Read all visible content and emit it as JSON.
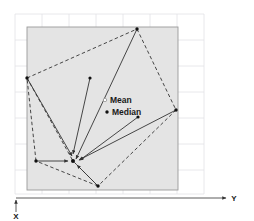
{
  "figure": {
    "title": "",
    "background_color": "#ffffff",
    "plot_fill_color": "#e4e4e4",
    "plot_border_color": "#9a9a9a",
    "grid_color": "#e0e0e4",
    "line_color": "#3a3a3a",
    "point_color": "#111111"
  },
  "axes": {
    "x_label": "X",
    "y_label": "Y",
    "x_axis_name": "vertical-axis",
    "y_axis_name": "horizontal-axis",
    "axis_color": "#3a3a3a"
  },
  "annotations": {
    "mean_label": "Mean",
    "median_label": "Median",
    "mean_marker": "open-circle",
    "median_marker": "filled-dot"
  },
  "chart_data": {
    "type": "scatter",
    "title": "",
    "xlabel": "Y",
    "ylabel": "X",
    "grid": true,
    "legend": null,
    "plot_region": {
      "x0": 27,
      "y0": 27,
      "x1": 178,
      "y1": 190
    },
    "convergence_point": {
      "x": 73,
      "y": 161,
      "name": "centroid"
    },
    "mean_point": {
      "x": 105,
      "y": 100
    },
    "median_point": {
      "x": 107,
      "y": 112
    },
    "polygon_vertices": [
      {
        "x": 137,
        "y": 29,
        "name": "vertex-top"
      },
      {
        "x": 176,
        "y": 110,
        "name": "vertex-right"
      },
      {
        "x": 98,
        "y": 186,
        "name": "vertex-bottom"
      },
      {
        "x": 36,
        "y": 161,
        "name": "vertex-lower-left"
      },
      {
        "x": 27,
        "y": 78,
        "name": "vertex-left"
      }
    ],
    "interior_points": [
      {
        "x": 90,
        "y": 78,
        "name": "interior-point-upper"
      },
      {
        "x": 138,
        "y": 117,
        "name": "interior-point-middle"
      }
    ],
    "arrows": [
      {
        "from": {
          "x": 137,
          "y": 29
        },
        "to": {
          "x": 76,
          "y": 159
        }
      },
      {
        "from": {
          "x": 176,
          "y": 110
        },
        "to": {
          "x": 79,
          "y": 160
        }
      },
      {
        "from": {
          "x": 98,
          "y": 186
        },
        "to": {
          "x": 77,
          "y": 165
        }
      },
      {
        "from": {
          "x": 36,
          "y": 161
        },
        "to": {
          "x": 68,
          "y": 161
        }
      },
      {
        "from": {
          "x": 27,
          "y": 78
        },
        "to": {
          "x": 72,
          "y": 156
        }
      },
      {
        "from": {
          "x": 90,
          "y": 78
        },
        "to": {
          "x": 73,
          "y": 154
        }
      },
      {
        "from": {
          "x": 138,
          "y": 117
        },
        "to": {
          "x": 80,
          "y": 160
        }
      }
    ],
    "dashed_edges": [
      {
        "from": {
          "x": 137,
          "y": 29
        },
        "to": {
          "x": 176,
          "y": 110
        }
      },
      {
        "from": {
          "x": 176,
          "y": 110
        },
        "to": {
          "x": 98,
          "y": 186
        }
      },
      {
        "from": {
          "x": 98,
          "y": 186
        },
        "to": {
          "x": 36,
          "y": 161
        }
      },
      {
        "from": {
          "x": 36,
          "y": 161
        },
        "to": {
          "x": 27,
          "y": 78
        }
      },
      {
        "from": {
          "x": 27,
          "y": 78
        },
        "to": {
          "x": 137,
          "y": 29
        }
      },
      {
        "from": {
          "x": 27,
          "y": 78
        },
        "to": {
          "x": 73,
          "y": 161
        }
      },
      {
        "from": {
          "x": 98,
          "y": 186
        },
        "to": {
          "x": 73,
          "y": 161
        }
      }
    ],
    "grid_x_lines": [
      15,
      42,
      69,
      96,
      123,
      150,
      177,
      204
    ],
    "grid_y_lines": [
      14,
      40,
      66,
      92,
      118,
      144,
      170,
      194
    ]
  }
}
